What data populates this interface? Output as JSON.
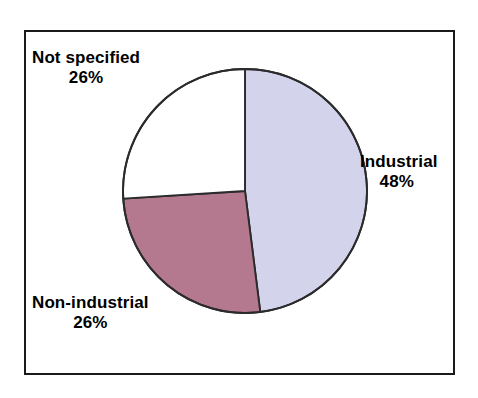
{
  "chart_data": {
    "type": "pie",
    "title": "",
    "subtitle": "",
    "xlabel": "",
    "ylabel": "",
    "legend_position": "none",
    "grid": false,
    "start_angle_deg": 0,
    "direction": "clockwise",
    "categories": [
      "Industrial",
      "Non-industrial",
      "Not specified"
    ],
    "values": [
      48,
      26,
      26
    ],
    "value_unit": "%",
    "slices": [
      {
        "label": "Industrial",
        "value": 48,
        "value_text": "48%",
        "color": "#d3d3ec",
        "start_deg": 0,
        "end_deg": 172.8,
        "label_position": "right"
      },
      {
        "label": "Non-industrial",
        "value": 26,
        "value_text": "26%",
        "color": "#b5798f",
        "start_deg": 172.8,
        "end_deg": 266.4,
        "label_position": "bottom-left"
      },
      {
        "label": "Not specified",
        "value": 26,
        "value_text": "26%",
        "color": "#ffffff",
        "start_deg": 266.4,
        "end_deg": 360,
        "label_position": "top-left"
      }
    ],
    "annotations": []
  },
  "frame": {
    "border_color": "#1a1a1a",
    "background": "#ffffff"
  },
  "pie": {
    "outline_color": "#2b2b2b",
    "center_x": 124,
    "center_y": 124,
    "radius": 122
  }
}
